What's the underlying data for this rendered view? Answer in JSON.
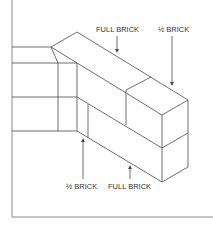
{
  "diagram": {
    "labels": {
      "top_full": "FULL BRICK",
      "top_half": "½ BRICK",
      "bottom_half": "½ BRICK",
      "bottom_full": "FULL BRICK"
    },
    "colors": {
      "line": "#4a4a4a",
      "frame": "#8a8a8a",
      "text": "#333333",
      "background": "#ffffff"
    }
  }
}
